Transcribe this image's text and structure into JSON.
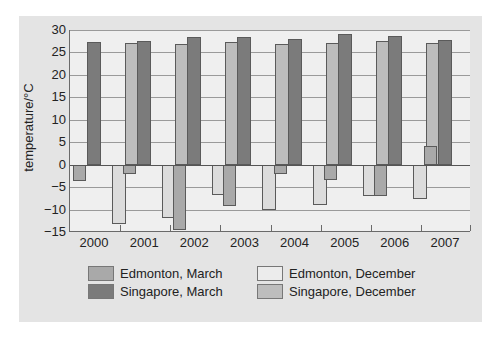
{
  "chart_data": {
    "type": "bar",
    "title": "",
    "xlabel": "",
    "ylabel": "temperature/°C",
    "ylim": [
      -15,
      30
    ],
    "yticks": [
      30,
      25,
      20,
      15,
      10,
      5,
      0,
      -5,
      -10,
      -15
    ],
    "grid": true,
    "legend_position": "bottom",
    "categories": [
      "2000",
      "2001",
      "2002",
      "2003",
      "2004",
      "2005",
      "2006",
      "2007"
    ],
    "series": [
      {
        "name": "Edmonton, March",
        "color": "#a9a9a9",
        "values": [
          -3.7,
          -2.0,
          -14.5,
          -9.3,
          -2.1,
          -3.4,
          -6.9,
          4.2
        ]
      },
      {
        "name": "Singapore, March",
        "color": "#7b7b7b",
        "values": [
          27.4,
          27.6,
          28.4,
          28.4,
          27.9,
          29.0,
          28.7,
          27.8
        ]
      },
      {
        "name": "Edmonton, December",
        "color": "#dcdcdc",
        "values": [
          -13.3,
          -11.8,
          -6.7,
          -10.1,
          -8.9,
          -7.0,
          -7.6,
          null
        ]
      },
      {
        "name": "Singapore, December",
        "color": "#bdbdbd",
        "values": [
          27.2,
          26.8,
          27.4,
          26.9,
          27.2,
          27.5,
          27.0,
          null
        ]
      }
    ]
  },
  "axis": {
    "ylabel": "temperature/°C"
  },
  "legend": [
    {
      "label": "Edmonton, March",
      "color": "#a9a9a9"
    },
    {
      "label": "Singapore, March",
      "color": "#7b7b7b"
    },
    {
      "label": "Edmonton, December",
      "color": "#ececec"
    },
    {
      "label": "Singapore, December",
      "color": "#bdbdbd"
    }
  ]
}
